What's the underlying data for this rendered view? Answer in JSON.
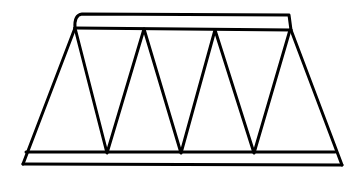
{
  "diagram": {
    "stroke_color": "#000000",
    "background_color": "#ffffff",
    "top_chord": {
      "outer": [
        [
          78,
          14
        ],
        [
          289,
          15
        ]
      ],
      "inner": [
        [
          75,
          28
        ],
        [
          291,
          30
        ]
      ]
    },
    "bottom_chord": {
      "upper": [
        [
          26,
          152
        ],
        [
          335,
          152
        ]
      ],
      "lower": [
        [
          23,
          164
        ],
        [
          342,
          165
        ]
      ]
    },
    "top_nodes": [
      [
        75,
        28
      ],
      [
        144,
        29
      ],
      [
        215,
        30
      ],
      [
        290,
        30
      ]
    ],
    "bottom_nodes": [
      [
        107,
        153
      ],
      [
        181,
        153
      ],
      [
        254,
        153
      ]
    ],
    "end_posts": [
      [
        [
          75,
          28
        ],
        [
          23,
          163
        ]
      ],
      [
        [
          290,
          30
        ],
        [
          342,
          165
        ]
      ]
    ]
  }
}
